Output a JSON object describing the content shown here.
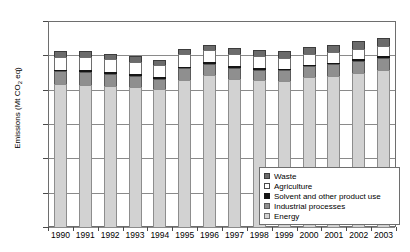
{
  "chart_data": {
    "type": "bar",
    "stacked": true,
    "title": "",
    "xlabel": "",
    "ylabel": "Emissions (Mt CO2 eq)",
    "ylabel_parts": {
      "prefix": "Emissions (Mt CO",
      "sub": "2",
      "suffix": " eq)"
    },
    "ylim": [
      0,
      600
    ],
    "ytick_labels": [
      "600.00",
      "500.00",
      "400.00",
      "300.00",
      "200.00",
      "100.00",
      "0.00"
    ],
    "ytick_values": [
      600,
      500,
      400,
      300,
      200,
      100,
      0
    ],
    "grid": true,
    "legend_position": "bottom-right",
    "categories": [
      "1990",
      "1991",
      "1992",
      "1993",
      "1994",
      "1995",
      "1996",
      "1997",
      "1998",
      "1999",
      "2000",
      "2001",
      "2002",
      "2003"
    ],
    "series": [
      {
        "name": "Energy",
        "color": "#d2d2d2",
        "values": [
          418,
          415,
          410,
          408,
          401,
          429,
          442,
          432,
          428,
          426,
          437,
          441,
          450,
          458
        ]
      },
      {
        "name": "Industrial processes",
        "color": "#8f8f8f",
        "values": [
          36,
          38,
          37,
          33,
          31,
          33,
          33,
          32,
          30,
          30,
          31,
          33,
          34,
          35
        ]
      },
      {
        "name": "Solvent and other product use",
        "color": "#151515",
        "values": [
          3,
          3,
          3,
          3,
          3,
          3,
          3,
          3,
          3,
          3,
          3,
          3,
          3,
          3
        ]
      },
      {
        "name": "Agriculture",
        "color": "#ffffff",
        "values": [
          38,
          38,
          37,
          36,
          35,
          37,
          36,
          35,
          35,
          33,
          33,
          32,
          31,
          31
        ]
      },
      {
        "name": "Waste",
        "color": "#6b6b6b",
        "values": [
          17,
          17,
          17,
          17,
          16,
          16,
          16,
          18,
          18,
          18,
          20,
          21,
          22,
          22
        ]
      }
    ],
    "totals": [
      512,
      511,
      504,
      497,
      486,
      518,
      530,
      520,
      514,
      510,
      524,
      530,
      540,
      549
    ]
  },
  "legend": {
    "items": [
      {
        "label": "Waste",
        "swatch": "waste"
      },
      {
        "label": "Agriculture",
        "swatch": "agriculture"
      },
      {
        "label": "Solvent and other product use",
        "swatch": "solvent"
      },
      {
        "label": "Industrial processes",
        "swatch": "industrial"
      },
      {
        "label": "Energy",
        "swatch": "energy"
      }
    ]
  },
  "colors": {
    "energy": "#d2d2d2",
    "industrial": "#8f8f8f",
    "solvent": "#151515",
    "agriculture": "#ffffff",
    "waste": "#6b6b6b",
    "axis": "#6e6e6e",
    "grid": "#8a8a8a"
  }
}
